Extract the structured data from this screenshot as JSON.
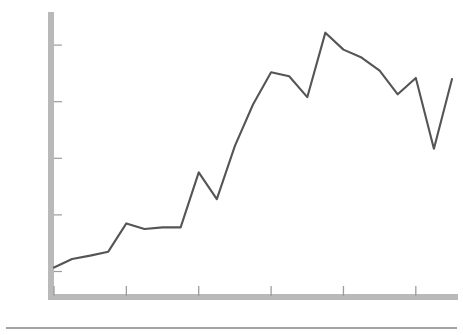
{
  "chart_data": {
    "type": "line",
    "title": "",
    "xlabel": "",
    "ylabel": "Residential Construction (billions of 1971 dollars)",
    "x": [
      1961,
      1962,
      1963,
      1964,
      1965,
      1966,
      1967,
      1968,
      1969,
      1970,
      1971,
      1972,
      1973,
      1974,
      1975,
      1976,
      1977,
      1978,
      1979,
      1980,
      1981,
      1982,
      1983
    ],
    "values": [
      2.57,
      2.72,
      2.78,
      2.85,
      3.35,
      3.25,
      3.28,
      3.28,
      4.25,
      3.78,
      4.72,
      5.45,
      6.02,
      5.95,
      5.58,
      6.72,
      6.42,
      6.28,
      6.05,
      5.63,
      5.92,
      4.67,
      5.9
    ],
    "series": [
      {
        "name": "Residential Construction",
        "values": [
          2.57,
          2.72,
          2.78,
          2.85,
          3.35,
          3.25,
          3.28,
          3.28,
          4.25,
          3.78,
          4.72,
          5.45,
          6.02,
          5.95,
          5.58,
          6.72,
          6.42,
          6.28,
          6.05,
          5.63,
          5.92,
          4.67,
          5.9
        ],
        "color": "#555555"
      }
    ],
    "ytick_labels": [
      "2.5",
      "3.5",
      "4.5",
      "5.5",
      "6.5"
    ],
    "ytick_values": [
      2.5,
      3.5,
      4.5,
      5.5,
      6.5
    ],
    "xtick_labels": [
      "1961",
      "1965",
      "1969",
      "1973",
      "1977",
      "1981"
    ],
    "xtick_values": [
      1961,
      1965,
      1969,
      1973,
      1977,
      1981
    ],
    "ylim": [
      2.1,
      7.0
    ],
    "xlim": [
      1961,
      1983
    ],
    "grid": false,
    "legend": "none",
    "axis_color": "#b8b8b8",
    "line_color": "#555555",
    "text_color": "#111111"
  }
}
